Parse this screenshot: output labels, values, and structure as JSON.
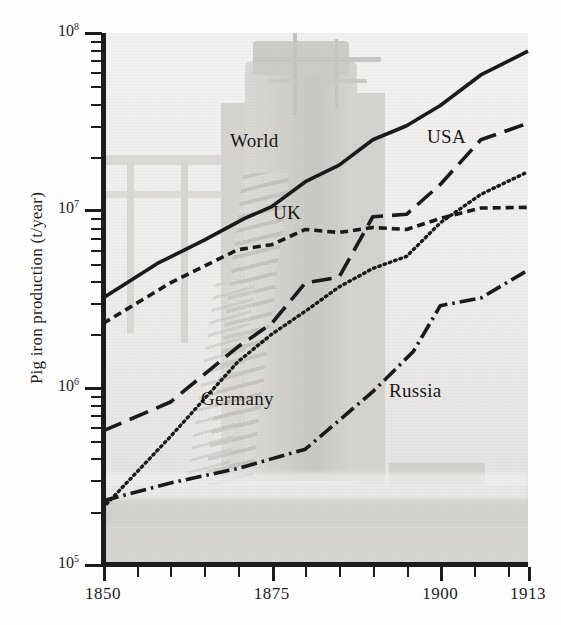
{
  "chart_data": {
    "type": "line",
    "title": "",
    "xlabel": "",
    "ylabel": "Pig iron production (t/year)",
    "xlim": [
      1850,
      1913
    ],
    "ylim": [
      100000,
      100000000
    ],
    "yscale": "log",
    "grid": false,
    "legend_position": "inline-labels",
    "background_image": "blast-furnace-photograph",
    "x_ticks_major": [
      1850,
      1875,
      1900,
      1913
    ],
    "x_tick_labels": [
      "1850",
      "1875",
      "1900",
      "1913"
    ],
    "x_ticks_minor": [
      1855,
      1860,
      1865,
      1870,
      1880,
      1885,
      1890,
      1895,
      1905,
      1910
    ],
    "y_ticks_major": [
      100000,
      1000000,
      10000000,
      100000000
    ],
    "y_tick_labels": [
      "10⁵",
      "10⁶",
      "10⁷",
      "10⁸"
    ],
    "series": [
      {
        "name": "World",
        "linestyle": "solid",
        "color": "#1a1a1a",
        "x": [
          1850,
          1858,
          1865,
          1871,
          1875,
          1880,
          1885,
          1890,
          1895,
          1900,
          1906,
          1913
        ],
        "values": [
          3200000,
          5000000,
          6800000,
          9000000,
          10500000,
          14500000,
          18000000,
          25000000,
          30000000,
          39000000,
          58000000,
          79000000
        ]
      },
      {
        "name": "USA",
        "linestyle": "long-dash",
        "color": "#1a1a1a",
        "x": [
          1850,
          1860,
          1870,
          1875,
          1880,
          1885,
          1890,
          1895,
          1900,
          1906,
          1913
        ],
        "values": [
          570000,
          830000,
          1700000,
          2300000,
          3900000,
          4200000,
          9200000,
          9500000,
          14000000,
          25000000,
          31000000
        ]
      },
      {
        "name": "UK",
        "linestyle": "short-dash",
        "color": "#1a1a1a",
        "x": [
          1850,
          1860,
          1870,
          1875,
          1880,
          1885,
          1890,
          1895,
          1900,
          1906,
          1913
        ],
        "values": [
          2300000,
          3900000,
          6000000,
          6400000,
          7800000,
          7500000,
          8000000,
          7800000,
          9000000,
          10300000,
          10400000
        ]
      },
      {
        "name": "Germany",
        "linestyle": "dotted",
        "color": "#1a1a1a",
        "x": [
          1850,
          1860,
          1870,
          1875,
          1880,
          1885,
          1890,
          1895,
          1900,
          1906,
          1913
        ],
        "values": [
          210000,
          530000,
          1400000,
          2000000,
          2700000,
          3700000,
          4700000,
          5500000,
          8500000,
          12300000,
          16500000
        ]
      },
      {
        "name": "Russia",
        "linestyle": "dash-dot",
        "color": "#1a1a1a",
        "x": [
          1850,
          1860,
          1870,
          1880,
          1890,
          1896,
          1900,
          1906,
          1913
        ],
        "values": [
          230000,
          290000,
          350000,
          450000,
          950000,
          1600000,
          2900000,
          3200000,
          4600000
        ]
      }
    ],
    "annotations": [
      {
        "text": "World",
        "x_px": 230,
        "y_px": 141
      },
      {
        "text": "USA",
        "x_px": 427,
        "y_px": 137
      },
      {
        "text": "UK",
        "x_px": 273,
        "y_px": 213
      },
      {
        "text": "Germany",
        "x_px": 201,
        "y_px": 399
      },
      {
        "text": "Russia",
        "x_px": 389,
        "y_px": 391
      }
    ]
  },
  "axis": {
    "ylabel": "Pig iron production (t/year)"
  }
}
